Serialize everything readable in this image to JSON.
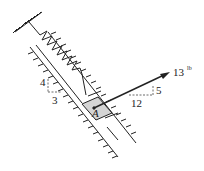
{
  "diagram": {
    "type": "mechanics-free-body",
    "block_label": "A",
    "force": {
      "magnitude": "13",
      "unit": "lb",
      "slope_horizontal": "12",
      "slope_vertical": "5"
    },
    "guide_slope": {
      "vertical": "4",
      "horizontal": "3"
    },
    "colors": {
      "line": "#222222",
      "block_fill": "#d4d4d4",
      "background": "#ffffff"
    }
  }
}
